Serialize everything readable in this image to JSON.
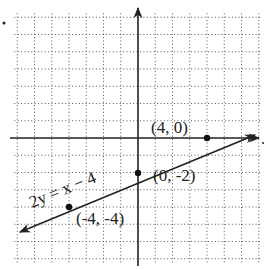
{
  "diagram": {
    "equation_label": "2y = x − 4",
    "points": [
      {
        "label": "(4, 0)",
        "x": 4,
        "y": 0
      },
      {
        "label": "(0, -2)",
        "x": 0,
        "y": -2
      },
      {
        "label": "(-4, -4)",
        "x": -4,
        "y": -4
      }
    ],
    "grid": {
      "xmin": -7,
      "xmax": 7,
      "ymin": -7,
      "ymax": 7,
      "step": 1
    },
    "colors": {
      "line": "#222222",
      "grid": "#555555",
      "background": "#ffffff"
    }
  }
}
